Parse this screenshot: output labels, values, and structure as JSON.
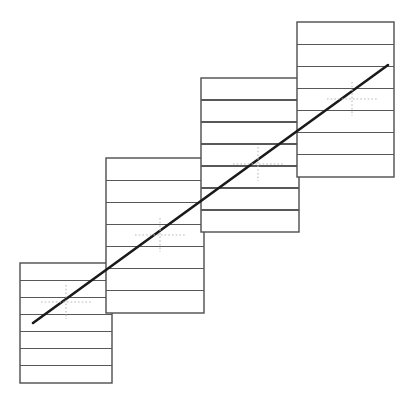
{
  "figure": {
    "canvas": {
      "width": 415,
      "height": 407
    },
    "background_color": "#ffffff"
  },
  "style": {
    "panel_stroke_color": "#4d4d4d",
    "row_divider_color": "#585858",
    "trend_line_color": "#1a1a1a",
    "crosshair_color": "#b9b9b9",
    "panel_fill": "#ffffff",
    "panel_stroke_width": 1.4,
    "row_divider_width": 1.25,
    "trend_line_width": 2.6
  },
  "chart_data": {
    "type": "scatter",
    "subtitle": "",
    "xlabel": "",
    "ylabel": "",
    "xlim": [
      0,
      415
    ],
    "ylim": [
      407,
      0
    ],
    "grid": false,
    "legend": "none",
    "axes_visible": false,
    "tick_labels_x": [],
    "tick_labels_y": [],
    "annotations": [],
    "series": [
      {
        "name": "panel-centroids",
        "marker": "dotted-crosshair",
        "points": [
          {
            "label": "centroid-1",
            "x": 66,
            "y": 302
          },
          {
            "label": "centroid-2",
            "x": 160,
            "y": 235
          },
          {
            "label": "centroid-3",
            "x": 258,
            "y": 164
          },
          {
            "label": "centroid-4",
            "x": 352,
            "y": 99
          }
        ]
      },
      {
        "name": "trend-line",
        "type": "line",
        "x": [
          33,
          388
        ],
        "y": [
          323,
          65
        ]
      }
    ]
  },
  "panels": [
    {
      "id": "panel-1",
      "label": "Panel 1",
      "x": 20,
      "y": 263,
      "width": 92,
      "height": 120,
      "rows": 7,
      "centroid": {
        "x": 66,
        "y": 302
      }
    },
    {
      "id": "panel-2",
      "label": "Panel 2",
      "x": 106,
      "y": 158,
      "width": 98,
      "height": 155,
      "rows": 7,
      "centroid": {
        "x": 160,
        "y": 235
      }
    },
    {
      "id": "panel-3",
      "label": "Panel 3",
      "x": 201,
      "y": 78,
      "width": 98,
      "height": 154,
      "rows": 7,
      "centroid": {
        "x": 258,
        "y": 164
      }
    },
    {
      "id": "panel-4",
      "label": "Panel 4",
      "x": 297,
      "y": 22,
      "width": 97,
      "height": 155,
      "rows": 7,
      "centroid": {
        "x": 352,
        "y": 99
      }
    }
  ],
  "trend_line": {
    "id": "trend-line",
    "label": "Trend line",
    "x1": 33,
    "y1": 323,
    "x2": 388,
    "y2": 65
  },
  "crosshairs": [
    {
      "id": "crosshair-1",
      "label": "Crosshair 1",
      "cx": 66,
      "cy": 302,
      "half_width": 25,
      "half_height": 17
    },
    {
      "id": "crosshair-2",
      "label": "Crosshair 2",
      "cx": 160,
      "cy": 235,
      "half_width": 25,
      "half_height": 17
    },
    {
      "id": "crosshair-3",
      "label": "Crosshair 3",
      "cx": 258,
      "cy": 164,
      "half_width": 25,
      "half_height": 17
    },
    {
      "id": "crosshair-4",
      "label": "Crosshair 4",
      "cx": 352,
      "cy": 99,
      "half_width": 25,
      "half_height": 17
    }
  ]
}
